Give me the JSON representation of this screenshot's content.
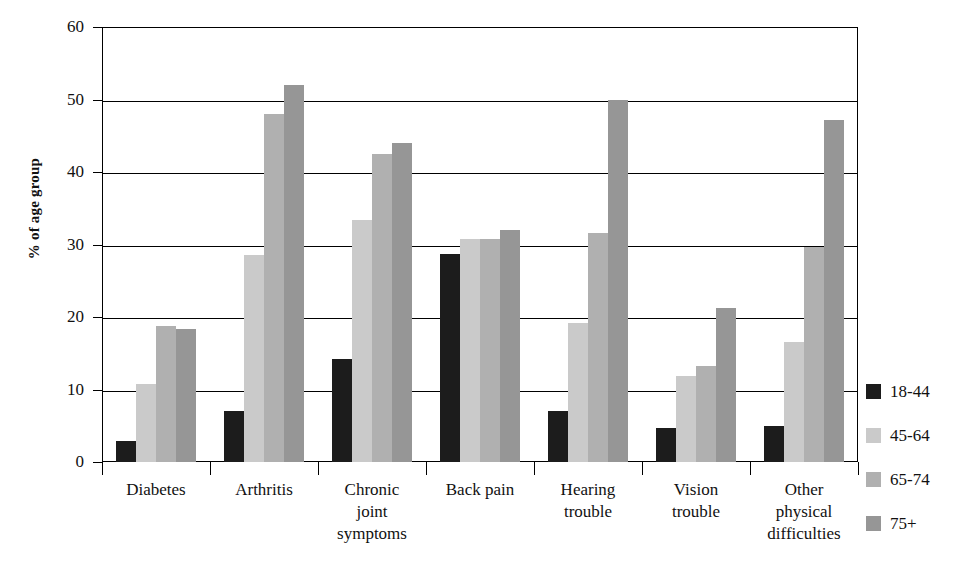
{
  "chart_data": {
    "type": "bar",
    "title": "",
    "subtitle": "",
    "xlabel": "",
    "ylabel": "% of age group",
    "ylim": [
      0,
      60
    ],
    "ytick_step": 10,
    "ytick_labels": [
      "0",
      "10",
      "20",
      "30",
      "40",
      "50",
      "60"
    ],
    "grid": true,
    "legend_position": "right",
    "categories": [
      "Diabetes",
      "Arthritis",
      "Chronic\njoint\nsymptoms",
      "Back pain",
      "Hearing\ntrouble",
      "Vision\ntrouble",
      "Other\nphysical\ndifficulties"
    ],
    "series": [
      {
        "name": "18-44",
        "color": "#1c1c1c",
        "values": [
          2.9,
          7.0,
          14.2,
          28.7,
          7.0,
          4.7,
          5.0
        ]
      },
      {
        "name": "45-64",
        "color": "#cacaca",
        "values": [
          10.7,
          28.6,
          33.4,
          30.8,
          19.2,
          11.8,
          16.5
        ]
      },
      {
        "name": "65-74",
        "color": "#b0b0b0",
        "values": [
          18.8,
          48.0,
          42.5,
          30.8,
          31.6,
          13.2,
          29.7
        ]
      },
      {
        "name": "75+",
        "color": "#969696",
        "values": [
          18.4,
          52.0,
          44.0,
          32.0,
          50.0,
          21.3,
          47.2
        ]
      }
    ]
  },
  "axis": {
    "y_title": "% of age group"
  },
  "legend": {
    "items": [
      {
        "label": "18-44",
        "color": "#1c1c1c"
      },
      {
        "label": "45-64",
        "color": "#cacaca"
      },
      {
        "label": "65-74",
        "color": "#b0b0b0"
      },
      {
        "label": "75+",
        "color": "#969696"
      }
    ]
  }
}
